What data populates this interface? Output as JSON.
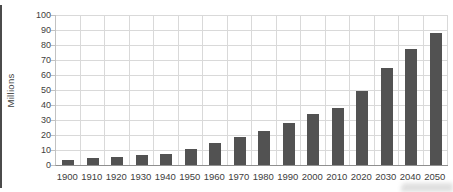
{
  "chart_data": {
    "type": "bar",
    "title": "",
    "xlabel": "",
    "ylabel": "Millions",
    "categories": [
      "1900",
      "1910",
      "1920",
      "1930",
      "1940",
      "1950",
      "1960",
      "1970",
      "1980",
      "1990",
      "2000",
      "2010",
      "2020",
      "2030",
      "2040",
      "2050"
    ],
    "values": [
      3.5,
      4.5,
      5.5,
      6.5,
      7.5,
      11,
      15,
      18.5,
      22.5,
      28,
      34,
      38,
      49.5,
      65,
      77.5,
      88
    ],
    "y_ticks": [
      0,
      10,
      20,
      30,
      40,
      50,
      60,
      70,
      80,
      90,
      100
    ],
    "ylim": [
      0,
      100
    ],
    "grid": "both",
    "legend": "none",
    "bar_color": "#525252",
    "gridline_color": "#d9d9d9",
    "text_color": "#404040"
  }
}
